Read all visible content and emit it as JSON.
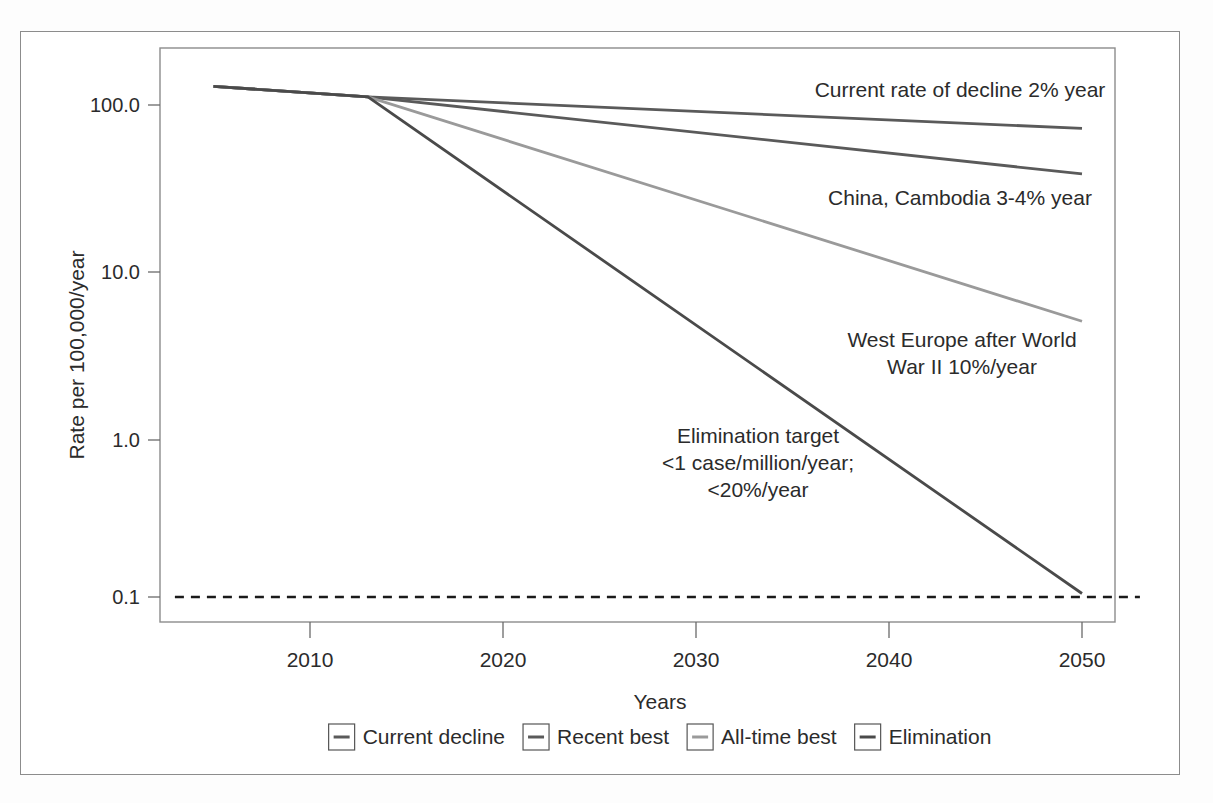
{
  "figure": {
    "background_color": "#ffffff",
    "frame_color": "#8c8c8c"
  },
  "chart_data": {
    "type": "line",
    "title": "",
    "subtitle": "",
    "xlabel": "Years",
    "ylabel": "Rate per 100,000/year",
    "yscale": "log",
    "xlim": [
      2003,
      2053
    ],
    "ylim": [
      0.08,
      180
    ],
    "grid": false,
    "legend_position": "bottom",
    "x_ticks": [
      "2010",
      "2020",
      "2030",
      "2040",
      "2050"
    ],
    "x_tick_values": [
      2010,
      2020,
      2030,
      2040,
      2050
    ],
    "y_ticks": [
      "100.0",
      "10.0",
      "1.0",
      "0.1"
    ],
    "y_tick_values": [
      100.0,
      10.0,
      1.0,
      0.1
    ],
    "series": [
      {
        "name": "Current decline",
        "color": "#5a5a5a",
        "style": "solid",
        "annual_decline_percent": 2,
        "x": [
          2005,
          2013,
          2050
        ],
        "values": [
          130,
          112,
          72
        ]
      },
      {
        "name": "Recent best",
        "color": "#5a5a5a",
        "style": "solid",
        "annual_decline_percent": 3.5,
        "x": [
          2005,
          2013,
          2050
        ],
        "values": [
          130,
          112,
          38
        ]
      },
      {
        "name": "All-time best",
        "color": "#9a9a9a",
        "style": "solid",
        "annual_decline_percent": 10,
        "x": [
          2005,
          2013,
          2050
        ],
        "values": [
          130,
          112,
          4.8
        ]
      },
      {
        "name": "Elimination",
        "color": "#4a4a4a",
        "style": "solid",
        "annual_decline_percent": 20,
        "x": [
          2005,
          2013,
          2050
        ],
        "values": [
          130,
          112,
          0.105
        ]
      },
      {
        "name": "Elimination threshold",
        "color": "#1a1a1a",
        "style": "dashed",
        "x": [
          2003,
          2053
        ],
        "values": [
          0.1,
          0.1
        ]
      }
    ],
    "annotations": [
      {
        "id": "current-decline-annotation",
        "lines": [
          "Current rate of decline 2% year"
        ],
        "x": 960,
        "y": 97
      },
      {
        "id": "recent-best-annotation",
        "lines": [
          "China, Cambodia 3-4% year"
        ],
        "x": 960,
        "y": 205
      },
      {
        "id": "all-time-best-annotation",
        "lines": [
          "West Europe after World",
          "War II 10%/year"
        ],
        "x": 962,
        "y": 347
      },
      {
        "id": "elimination-annotation",
        "lines": [
          "Elimination target",
          "<1 case/million/year;",
          "<20%/year"
        ],
        "x": 758,
        "y": 443
      }
    ]
  },
  "legend": {
    "items": [
      {
        "label": "Current decline",
        "color": "#5a5a5a"
      },
      {
        "label": "Recent best",
        "color": "#5a5a5a"
      },
      {
        "label": "All-time best",
        "color": "#9a9a9a"
      },
      {
        "label": "Elimination",
        "color": "#4a4a4a"
      }
    ]
  }
}
